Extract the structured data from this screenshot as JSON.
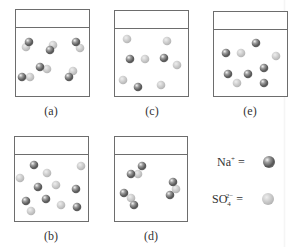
{
  "figure": {
    "colors": {
      "na_ion": "#8a8a8a",
      "so4_ion": "#c9c9c9",
      "border": "#6d6d6d"
    },
    "panels": [
      {
        "id": "a",
        "label": "(a)",
        "box": {
          "x": 15,
          "y": 9,
          "w": 75,
          "h": 88,
          "rim_y": 17
        },
        "particles": [
          {
            "ion": "so4",
            "x": 26,
            "y": 47
          },
          {
            "ion": "na",
            "x": 29,
            "y": 42
          },
          {
            "ion": "so4",
            "x": 53,
            "y": 45
          },
          {
            "ion": "na",
            "x": 50,
            "y": 50
          },
          {
            "ion": "so4",
            "x": 80,
            "y": 48
          },
          {
            "ion": "na",
            "x": 76,
            "y": 42
          },
          {
            "ion": "so4",
            "x": 47,
            "y": 69
          },
          {
            "ion": "na",
            "x": 40,
            "y": 67
          },
          {
            "ion": "so4",
            "x": 30,
            "y": 77
          },
          {
            "ion": "na",
            "x": 22,
            "y": 77
          },
          {
            "ion": "so4",
            "x": 73,
            "y": 71
          },
          {
            "ion": "na",
            "x": 69,
            "y": 77
          }
        ],
        "label_pos": {
          "x": 51,
          "y": 104
        }
      },
      {
        "id": "c",
        "label": "(c)",
        "box": {
          "x": 114,
          "y": 10,
          "w": 75,
          "h": 87,
          "rim_y": 17
        },
        "particles": [
          {
            "ion": "so4",
            "x": 127,
            "y": 39
          },
          {
            "ion": "so4",
            "x": 167,
            "y": 41
          },
          {
            "ion": "na",
            "x": 130,
            "y": 59
          },
          {
            "ion": "so4",
            "x": 145,
            "y": 59
          },
          {
            "ion": "na",
            "x": 164,
            "y": 58
          },
          {
            "ion": "so4",
            "x": 177,
            "y": 65
          },
          {
            "ion": "so4",
            "x": 123,
            "y": 80
          },
          {
            "ion": "na",
            "x": 138,
            "y": 87
          },
          {
            "ion": "so4",
            "x": 161,
            "y": 85
          }
        ],
        "label_pos": {
          "x": 152,
          "y": 104
        }
      },
      {
        "id": "e",
        "label": "(e)",
        "box": {
          "x": 213,
          "y": 11,
          "w": 75,
          "h": 86,
          "rim_y": 17
        },
        "particles": [
          {
            "ion": "na",
            "x": 256,
            "y": 43
          },
          {
            "ion": "na",
            "x": 226,
            "y": 53
          },
          {
            "ion": "so4",
            "x": 241,
            "y": 53
          },
          {
            "ion": "so4",
            "x": 276,
            "y": 56
          },
          {
            "ion": "na",
            "x": 228,
            "y": 74
          },
          {
            "ion": "na",
            "x": 248,
            "y": 74
          },
          {
            "ion": "na",
            "x": 264,
            "y": 68
          },
          {
            "ion": "so4",
            "x": 237,
            "y": 83
          },
          {
            "ion": "na",
            "x": 264,
            "y": 83
          }
        ],
        "label_pos": {
          "x": 250,
          "y": 104
        }
      },
      {
        "id": "b",
        "label": "(b)",
        "box": {
          "x": 14,
          "y": 136,
          "w": 75,
          "h": 86,
          "rim_y": 17
        },
        "particles": [
          {
            "ion": "na",
            "x": 34,
            "y": 165
          },
          {
            "ion": "so4",
            "x": 81,
            "y": 166
          },
          {
            "ion": "so4",
            "x": 20,
            "y": 178
          },
          {
            "ion": "so4",
            "x": 47,
            "y": 173
          },
          {
            "ion": "na",
            "x": 38,
            "y": 187
          },
          {
            "ion": "so4",
            "x": 56,
            "y": 185
          },
          {
            "ion": "na",
            "x": 76,
            "y": 189
          },
          {
            "ion": "na",
            "x": 26,
            "y": 201
          },
          {
            "ion": "na",
            "x": 46,
            "y": 199
          },
          {
            "ion": "so4",
            "x": 61,
            "y": 205
          },
          {
            "ion": "so4",
            "x": 31,
            "y": 211
          },
          {
            "ion": "na",
            "x": 77,
            "y": 207
          }
        ],
        "label_pos": {
          "x": 51,
          "y": 229
        }
      },
      {
        "id": "d",
        "label": "(d)",
        "box": {
          "x": 114,
          "y": 136,
          "w": 74,
          "h": 86,
          "rim_y": 17
        },
        "particles": [
          {
            "ion": "so4",
            "x": 138,
            "y": 174
          },
          {
            "ion": "na",
            "x": 142,
            "y": 166
          },
          {
            "ion": "na",
            "x": 131,
            "y": 174
          },
          {
            "ion": "so4",
            "x": 176,
            "y": 189
          },
          {
            "ion": "na",
            "x": 173,
            "y": 182
          },
          {
            "ion": "na",
            "x": 170,
            "y": 195
          },
          {
            "ion": "so4",
            "x": 131,
            "y": 198
          },
          {
            "ion": "na",
            "x": 124,
            "y": 193
          },
          {
            "ion": "na",
            "x": 134,
            "y": 205
          }
        ],
        "label_pos": {
          "x": 151,
          "y": 229
        }
      }
    ],
    "legend": {
      "na": {
        "text": "Na",
        "sup": "+",
        "eq": "=",
        "x": 269,
        "y": 162
      },
      "so4": {
        "text": "SO",
        "sub": "4",
        "sup": "2−",
        "eq": "=",
        "x": 268,
        "y": 199
      }
    }
  }
}
